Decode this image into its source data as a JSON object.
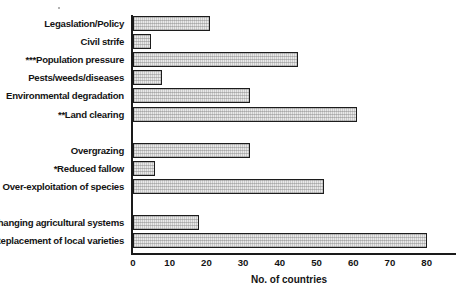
{
  "chart_data": {
    "type": "bar",
    "orientation": "horizontal",
    "title": "",
    "xlabel": "No. of countries",
    "ylabel": "",
    "xlim": [
      0,
      85
    ],
    "xticks": [
      0,
      10,
      20,
      30,
      40,
      50,
      60,
      70,
      80
    ],
    "grid": false,
    "legend": null,
    "groups": [
      {
        "categories": [
          "Legaslation/Policy",
          "Civil strife",
          "***Population pressure",
          "Pests/weeds/diseases",
          "Environmental degradation",
          "**Land clearing"
        ],
        "values": [
          21,
          5,
          45,
          8,
          32,
          61
        ]
      },
      {
        "categories": [
          "Overgrazing",
          "*Reduced fallow",
          "Over-exploitation of species"
        ],
        "values": [
          32,
          6,
          52
        ]
      },
      {
        "categories": [
          "Changing agricultural systems",
          "Replacement of local varieties"
        ],
        "values": [
          18,
          80
        ]
      }
    ],
    "categories": [
      "Legaslation/Policy",
      "Civil strife",
      "***Population pressure",
      "Pests/weeds/diseases",
      "Environmental degradation",
      "**Land clearing",
      "Overgrazing",
      "*Reduced fallow",
      "Over-exploitation of species",
      "Changing agricultural systems",
      "Replacement of local varieties"
    ],
    "values": [
      21,
      5,
      45,
      8,
      32,
      61,
      32,
      6,
      52,
      18,
      80
    ],
    "bar_face_color": "#e9e9e9",
    "bar_edge_color": "#1c1c1c",
    "axis_color": "#1a1a1a"
  }
}
